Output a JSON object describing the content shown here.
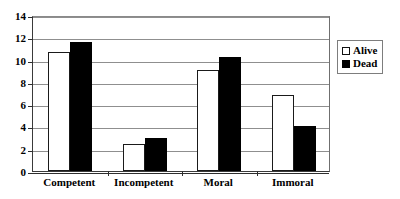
{
  "chart_data": {
    "type": "bar",
    "title": "",
    "subtitle": "",
    "xlabel": "",
    "ylabel": "",
    "ylim": [
      0,
      14
    ],
    "ytick_step": 2,
    "yticks": [
      "0",
      "2",
      "4",
      "6",
      "8",
      "10",
      "12",
      "14"
    ],
    "grid": true,
    "legend_position": "right",
    "categories": [
      "Competent",
      "Incompetent",
      "Moral",
      "Immoral"
    ],
    "series": [
      {
        "name": "Alive",
        "color": "#ffffff",
        "values": [
          10.7,
          2.4,
          9.1,
          6.8
        ]
      },
      {
        "name": "Dead",
        "color": "#000000",
        "values": [
          11.6,
          3.0,
          10.2,
          4.0
        ]
      }
    ]
  },
  "legend": {
    "items": [
      {
        "label": "Alive",
        "swatch": "hollow-square-icon"
      },
      {
        "label": "Dead",
        "swatch": "filled-square-icon"
      }
    ]
  }
}
